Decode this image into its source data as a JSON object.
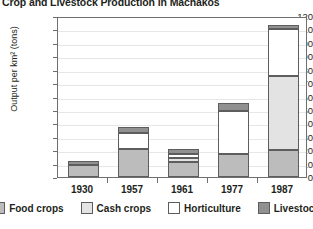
{
  "chart_data": {
    "type": "bar",
    "subtype": "stacked",
    "title": "Crop and Livestock Production in Machakos",
    "xlabel": "",
    "ylabel": "Output per km² (tons)",
    "categories": [
      "1930",
      "1957",
      "1961",
      "1977",
      "1987"
    ],
    "ylim": [
      0,
      120
    ],
    "ytick_step": 10,
    "yticks": [
      "0",
      "10",
      "20",
      "30",
      "40",
      "50",
      "60",
      "70",
      "80",
      "90",
      "100",
      "110",
      "120"
    ],
    "grid": true,
    "legend_position": "bottom",
    "series": [
      {
        "name": "Food crops",
        "color": "#bcbcbc",
        "values": [
          9,
          21,
          11,
          17,
          20
        ]
      },
      {
        "name": "Cash crops",
        "color": "#e3e3e3",
        "values": [
          0,
          0,
          3,
          0,
          55
        ]
      },
      {
        "name": "Horticulture",
        "color": "#ffffff",
        "values": [
          0,
          12,
          3,
          32,
          35
        ]
      },
      {
        "name": "Livestock",
        "color": "#919191",
        "values": [
          3,
          4,
          4,
          6,
          3
        ]
      }
    ],
    "totals": [
      12,
      37,
      21,
      55,
      113
    ]
  },
  "legend": {
    "items": [
      {
        "label": "Food crops"
      },
      {
        "label": "Cash crops"
      },
      {
        "label": "Horticulture"
      },
      {
        "label": "Livestock"
      }
    ]
  }
}
